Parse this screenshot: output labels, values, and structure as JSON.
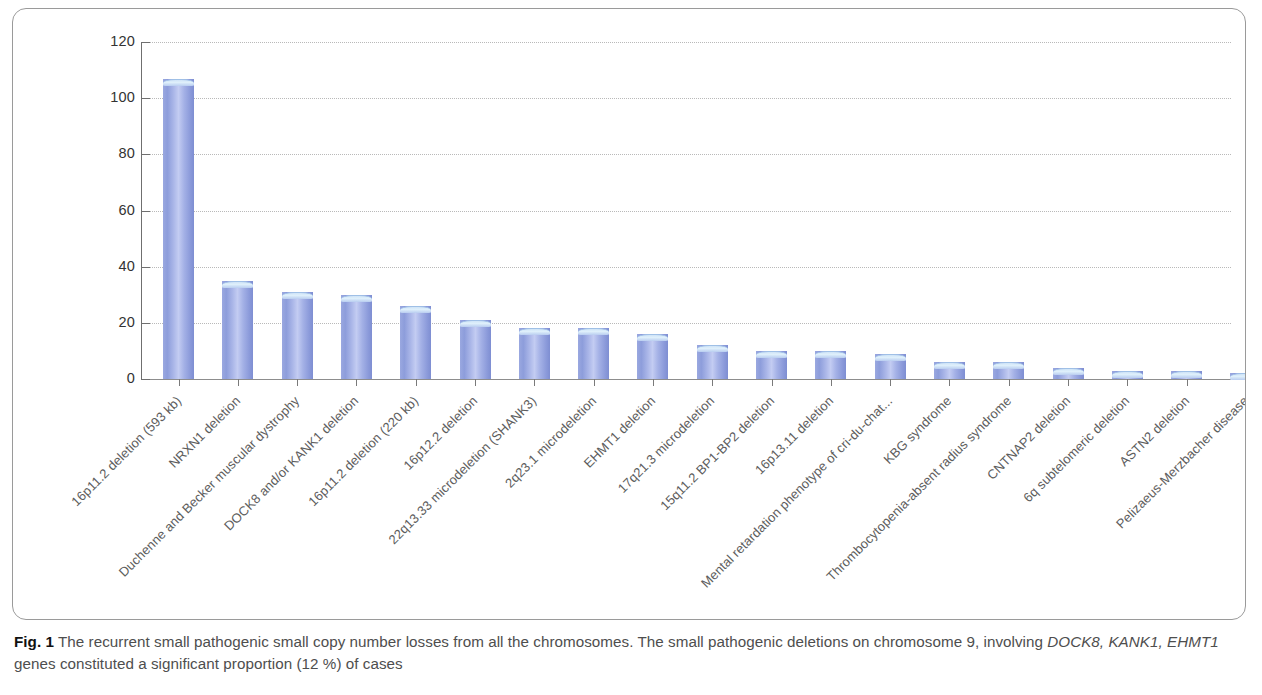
{
  "figure": {
    "caption_label": "Fig. 1",
    "caption_text_1": "The recurrent small pathogenic small copy number losses from all the chromosomes. The small pathogenic deletions on chromosome 9, involving ",
    "caption_genes": "DOCK8, KANK1, EHMT1",
    "caption_text_2": " genes constituted a significant proportion (12 %) of cases"
  },
  "chart_data": {
    "type": "bar",
    "title": "",
    "xlabel": "",
    "ylabel": "",
    "ylim": [
      0,
      120
    ],
    "yticks": [
      0,
      20,
      40,
      60,
      80,
      100,
      120
    ],
    "grid": true,
    "legend": "none",
    "bar_color": "#9aa8e0",
    "bar_cap_color": "#d5eafb",
    "categories": [
      "16p11.2 deletion (593 kb)",
      "NRXN1 deletion",
      "Duchenne and Becker muscular dystrophy",
      "DOCK8 and/or KANK1 deletion",
      "16p11.2 deletion (220 kb)",
      "16p12.2 deletion",
      "22q13.33 microdeletion (SHANK3)",
      "2q23.1 microdeletion",
      "EHMT1 deletion",
      "17q21.3 microdeletion",
      "15q11.2 BP1-BP2 deletion",
      "16p13.11 deletion",
      "Mental retardation phenotype of cri-du-chat...",
      "KBG syndrome",
      "Thrombocytopenia-absent radius syndrome",
      "CNTNAP2 deletion",
      "6q subtelomeric deletion",
      "ASTN2 deletion",
      "Pelizaeus-Merzbacher disease"
    ],
    "values": [
      107,
      35,
      31,
      30,
      26,
      21,
      18,
      18,
      16,
      12,
      10,
      10,
      9,
      6,
      6,
      4,
      3,
      3,
      2
    ]
  }
}
